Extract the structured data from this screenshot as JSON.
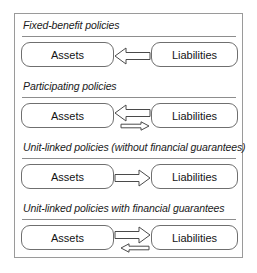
{
  "diagram": {
    "frame_border_color": "#9a9a9a",
    "box_border_color": "#6f6f6f",
    "arrow_stroke_color": "#4a4a4a",
    "background_color": "#ffffff",
    "sections": [
      {
        "heading": "Fixed-benefit policies",
        "left_node": "Assets",
        "right_node": "Liabilities",
        "arrows": [
          {
            "direction": "left",
            "size": "large",
            "name": "liabilities-to-assets-arrow"
          }
        ]
      },
      {
        "heading": "Participating policies",
        "left_node": "Assets",
        "right_node": "Liabilities",
        "arrows": [
          {
            "direction": "left",
            "size": "large",
            "name": "liabilities-to-assets-arrow"
          },
          {
            "direction": "right",
            "size": "small",
            "name": "assets-to-liabilities-arrow"
          }
        ]
      },
      {
        "heading": "Unit-linked policies (without financial guarantees)",
        "left_node": "Assets",
        "right_node": "Liabilities",
        "arrows": [
          {
            "direction": "right",
            "size": "large",
            "name": "assets-to-liabilities-arrow"
          }
        ]
      },
      {
        "heading": "Unit-linked policies with financial guarantees",
        "left_node": "Assets",
        "right_node": "Liabilities",
        "arrows": [
          {
            "direction": "right",
            "size": "large",
            "name": "assets-to-liabilities-arrow"
          },
          {
            "direction": "left",
            "size": "small",
            "name": "liabilities-to-assets-arrow"
          }
        ]
      }
    ]
  }
}
